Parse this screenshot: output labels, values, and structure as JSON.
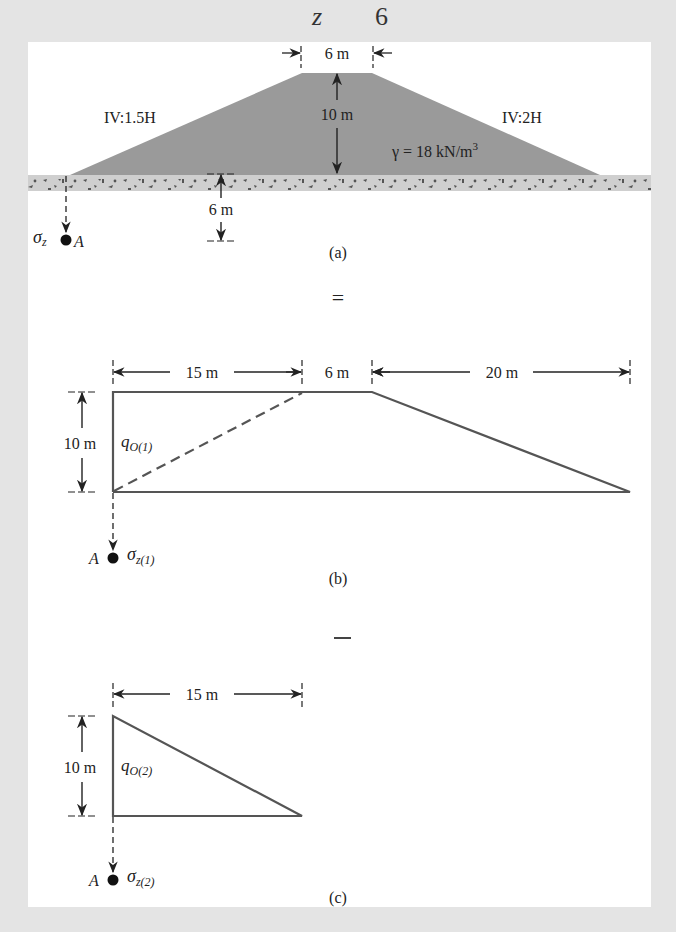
{
  "header": {
    "fragment_left": "z",
    "fragment_right": "6"
  },
  "colors": {
    "background": "#e4e4e4",
    "panel": "#ffffff",
    "embankment_fill": "#9a9a9a",
    "ground_fill": "#cfcfcf",
    "line": "#555555",
    "ink": "#222222"
  },
  "figure_a": {
    "caption": "(a)",
    "top_width_label": "6 m",
    "height_label": "10 m",
    "left_slope_label": "IV:1.5H",
    "right_slope_label": "IV:2H",
    "unit_weight_label": "γ = 18 kN/m",
    "unit_weight_exp": "3",
    "depth_label": "6 m",
    "stress_symbol": "σ",
    "stress_subscript": "z",
    "point_label": "A"
  },
  "operator_equals": "=",
  "figure_b": {
    "caption": "(b)",
    "dim_left_label": "15 m",
    "dim_middle_label": "6 m",
    "dim_right_label": "20 m",
    "height_label": "10 m",
    "load_symbol": "q",
    "load_subscript": "O(1)",
    "stress_symbol": "σ",
    "stress_subscript": "z(1)",
    "point_label": "A"
  },
  "operator_minus": "–",
  "figure_c": {
    "caption": "(c)",
    "dim_label": "15 m",
    "height_label": "10 m",
    "load_symbol": "q",
    "load_subscript": "O(2)",
    "stress_symbol": "σ",
    "stress_subscript": "z(2)",
    "point_label": "A"
  }
}
